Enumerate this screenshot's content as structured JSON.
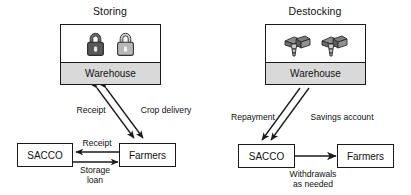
{
  "diagram": {
    "panels": [
      {
        "id": "storing",
        "title": "Storing",
        "warehouse_label": "Warehouse",
        "warehouse_icons": [
          "padlock-dark-icon",
          "padlock-light-icon"
        ],
        "entities": [
          {
            "id": "sacco",
            "label": "SACCO"
          },
          {
            "id": "farmers",
            "label": "Farmers"
          }
        ],
        "edges": [
          {
            "id": "receipt-up",
            "label": "Receipt",
            "from": "warehouse",
            "to": "farmers",
            "direction": "both"
          },
          {
            "id": "crop-delivery",
            "label": "Crop delivery",
            "from": "farmers",
            "to": "warehouse",
            "direction": "both"
          },
          {
            "id": "receipt-left",
            "label": "Receipt",
            "from": "farmers",
            "to": "sacco",
            "direction": "left"
          },
          {
            "id": "storage-loan",
            "label": "Storage loan",
            "label_line1": "Storage",
            "label_line2": "loan",
            "from": "sacco",
            "to": "farmers",
            "direction": "right"
          }
        ]
      },
      {
        "id": "destocking",
        "title": "Destocking",
        "warehouse_label": "Warehouse",
        "warehouse_icons": [
          "money-stack-icon",
          "money-stack-icon"
        ],
        "entities": [
          {
            "id": "sacco",
            "label": "SACCO"
          },
          {
            "id": "farmers",
            "label": "Farmers"
          }
        ],
        "edges": [
          {
            "id": "repayment",
            "label": "Repayment",
            "from": "warehouse",
            "to": "sacco",
            "direction": "down"
          },
          {
            "id": "savings-account",
            "label": "Savings account",
            "from": "warehouse",
            "to": "sacco",
            "direction": "down"
          },
          {
            "id": "withdrawals",
            "label": "Withdrawals as needed",
            "label_line1": "Withdrawals",
            "label_line2": "as needed",
            "from": "sacco",
            "to": "farmers",
            "direction": "both"
          }
        ]
      }
    ],
    "colors": {
      "stroke": "#1a1a1a",
      "warehouse_band": "#d9d9d9",
      "lock_dark": "#585858",
      "lock_light": "#b8b8b8",
      "money_green": "#8a8a8a",
      "background": "#ffffff"
    }
  }
}
